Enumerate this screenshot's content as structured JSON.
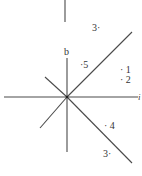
{
  "diagram": {
    "stroke_color": "#4a4a4a",
    "text_color": "#333333",
    "lines": [
      {
        "name": "top-vertical-segment",
        "x1": 65,
        "y1": 0,
        "x2": 65,
        "y2": 22
      },
      {
        "name": "vertical-axis",
        "x1": 67,
        "y1": 58,
        "x2": 67,
        "y2": 152
      },
      {
        "name": "horizontal-axis",
        "x1": 4,
        "y1": 97,
        "x2": 138,
        "y2": 97
      },
      {
        "name": "diagonal-upper-right",
        "x1": 67,
        "y1": 97,
        "x2": 132,
        "y2": 32
      },
      {
        "name": "diagonal-lower-right",
        "x1": 67,
        "y1": 97,
        "x2": 132,
        "y2": 163
      },
      {
        "name": "diagonal-upper-left",
        "x1": 45,
        "y1": 77,
        "x2": 67,
        "y2": 97
      },
      {
        "name": "diagonal-lower-left",
        "x1": 67,
        "y1": 97,
        "x2": 40,
        "y2": 128
      }
    ],
    "labels": {
      "top_three": "3·",
      "b": "b",
      "five": "·5",
      "one": "· 1",
      "two": "· 2",
      "four": "· 4",
      "bottom_three": "3·",
      "axis_end": "i"
    }
  }
}
